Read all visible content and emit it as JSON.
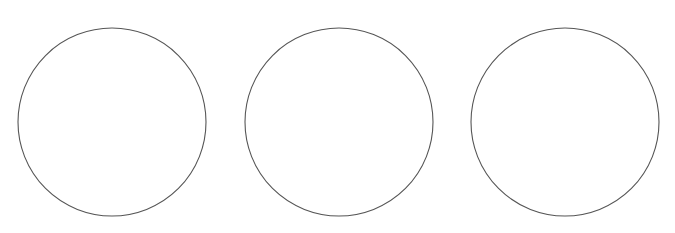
{
  "canvas": {
    "width": 675,
    "height": 233,
    "background": "#ffffff"
  },
  "circles": [
    {
      "cx": 112,
      "cy": 122,
      "r": 94,
      "stroke": "#555555"
    },
    {
      "cx": 339,
      "cy": 122,
      "r": 94,
      "stroke": "#555555"
    },
    {
      "cx": 565,
      "cy": 122,
      "r": 94,
      "stroke": "#555555"
    }
  ]
}
